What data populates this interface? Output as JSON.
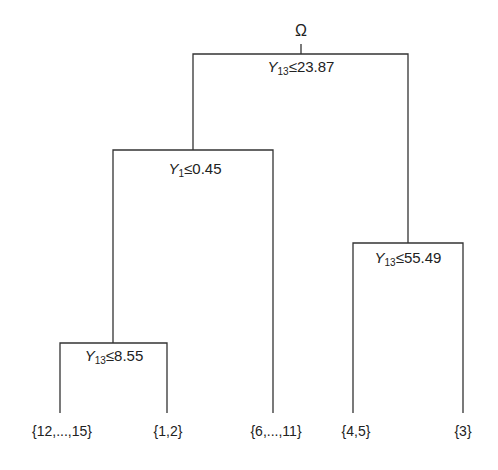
{
  "diagram": {
    "type": "decision-tree",
    "root": {
      "label": "Ω",
      "split": {
        "var": "Y",
        "sub": "13",
        "op": "≤",
        "value": "23.87"
      }
    },
    "nodes": {
      "left": {
        "var": "Y",
        "sub": "1",
        "op": "≤",
        "value": "0.45"
      },
      "right": {
        "var": "Y",
        "sub": "13",
        "op": "≤",
        "value": "55.49"
      },
      "left_left": {
        "var": "Y",
        "sub": "13",
        "op": "≤",
        "value": "8.55"
      }
    },
    "leaves": [
      {
        "label": "{12,...,15}"
      },
      {
        "label": "{1,2}"
      },
      {
        "label": "{6,...,11}"
      },
      {
        "label": "{4,5}"
      },
      {
        "label": "{3}"
      }
    ],
    "line_color": "#333333"
  }
}
